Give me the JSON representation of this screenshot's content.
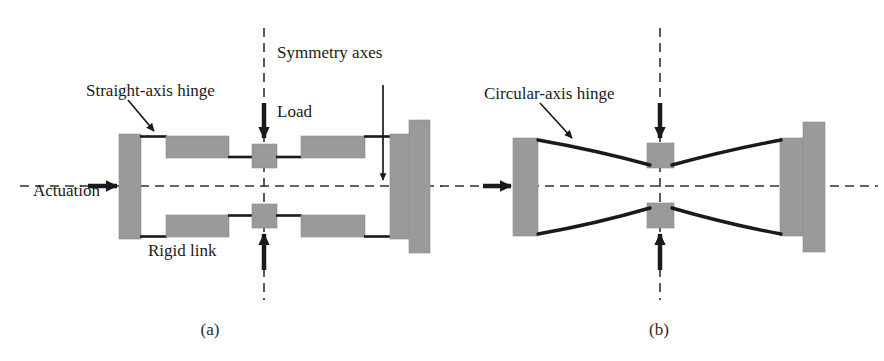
{
  "figure": {
    "width": 884,
    "height": 361,
    "background": "#ffffff",
    "block_fill": "#9a9a9a",
    "block_stroke": "#8a8a8a",
    "line_color": "#1a1a1a",
    "dash_color": "#303030"
  },
  "panel_a": {
    "caption": "(a)",
    "labels": {
      "straight_axis_hinge": "Straight-axis hinge",
      "symmetry_axes": "Symmetry axes",
      "load": "Load",
      "actuation": "Actuation",
      "rigid_link": "Rigid link"
    }
  },
  "panel_b": {
    "caption": "(b)",
    "labels": {
      "circular_axis_hinge": "Circular-axis hinge"
    }
  },
  "icons": {
    "load_arrow_down": "arrow-down-icon",
    "load_arrow_up": "arrow-up-icon",
    "actuation_arrow_right": "arrow-right-icon",
    "leader_arrow": "leader-arrow-icon",
    "symmetry_axis_vertical": "vertical-dashed-axis-icon",
    "symmetry_axis_horizontal": "horizontal-dashed-axis-icon"
  }
}
